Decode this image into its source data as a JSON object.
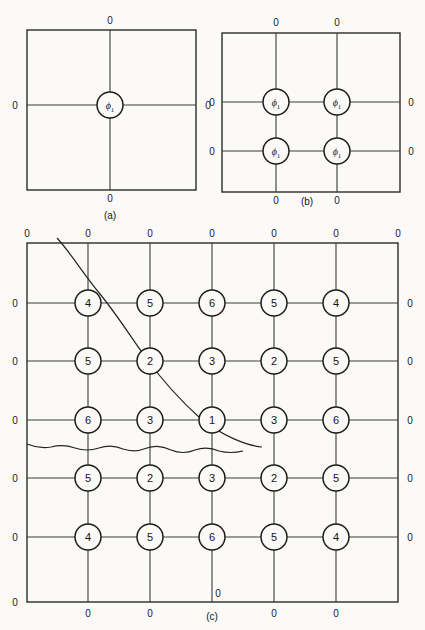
{
  "figure": {
    "background_color": "#fbfaf8",
    "line_color": "#2b2b2b",
    "boundary_zero_label": "0",
    "panels": [
      {
        "id": "a",
        "caption": "(a)",
        "grid_rows": 1,
        "grid_cols": 1,
        "node_label": "ϕ",
        "node_subscript": "1",
        "nodes": [
          [
            "ϕ₁"
          ]
        ],
        "zero_markers": {
          "top": 1,
          "bottom": 1,
          "left": 1,
          "right": 1
        }
      },
      {
        "id": "b",
        "caption": "(b)",
        "grid_rows": 2,
        "grid_cols": 2,
        "node_label": "ϕ",
        "node_subscript": "1",
        "nodes": [
          [
            "ϕ₁",
            "ϕ₁"
          ],
          [
            "ϕ₁",
            "ϕ₁"
          ]
        ],
        "zero_markers": {
          "top": 2,
          "bottom": 2,
          "left": 2,
          "right": 2
        }
      },
      {
        "id": "c",
        "caption": "(c)",
        "grid_rows": 5,
        "grid_cols": 5,
        "nodes": [
          [
            "4",
            "5",
            "6",
            "5",
            "4"
          ],
          [
            "5",
            "2",
            "3",
            "2",
            "5"
          ],
          [
            "6",
            "3",
            "1",
            "3",
            "6"
          ],
          [
            "5",
            "2",
            "3",
            "2",
            "5"
          ],
          [
            "4",
            "5",
            "6",
            "5",
            "4"
          ]
        ],
        "zero_markers": {
          "top": 7,
          "bottom": 7,
          "left": 6,
          "right": 6
        },
        "extra_zero_markers": [
          "bottom-center-inner"
        ],
        "annotations": [
          {
            "name": "diagonal-boundary-curve",
            "type": "curve"
          },
          {
            "name": "wavy-boundary-curve",
            "type": "wavy-line"
          }
        ]
      }
    ]
  },
  "labels": {
    "zero": "0",
    "caption_a": "(a)",
    "caption_b": "(b)",
    "caption_c": "(c)",
    "phi": "ϕ",
    "phi_subscript": "1",
    "node_values_panel_c": [
      "4",
      "5",
      "6",
      "5",
      "4",
      "5",
      "2",
      "3",
      "2",
      "5",
      "6",
      "3",
      "1",
      "3",
      "6",
      "5",
      "2",
      "3",
      "2",
      "5",
      "4",
      "5",
      "6",
      "5",
      "4"
    ]
  }
}
